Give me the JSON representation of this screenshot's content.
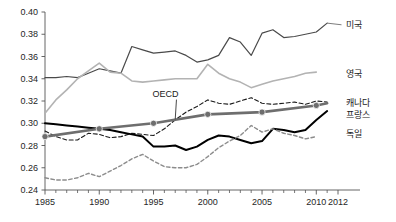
{
  "chart_data": {
    "type": "line",
    "title": "",
    "subtitle": "",
    "xlabel": "",
    "ylabel": "",
    "xlim": [
      1985,
      2012
    ],
    "ylim": [
      0.24,
      0.4
    ],
    "grid": false,
    "legend_position": "right-inline",
    "x_ticks_major": [
      "1985",
      "1990",
      "1995",
      "2000",
      "2005",
      "2010",
      "2012"
    ],
    "x_tick_values_major": [
      1985,
      1990,
      1995,
      2000,
      2005,
      2010,
      2012
    ],
    "x_tick_values_minor": [
      1986,
      1987,
      1988,
      1989,
      1991,
      1992,
      1993,
      1994,
      1996,
      1997,
      1998,
      1999,
      2001,
      2002,
      2003,
      2004,
      2006,
      2007,
      2008,
      2009,
      2011
    ],
    "y_ticks": [
      "0.24",
      "0.26",
      "0.28",
      "0.30",
      "0.32",
      "0.34",
      "0.36",
      "0.38",
      "0.40"
    ],
    "y_tick_values": [
      0.24,
      0.26,
      0.28,
      0.3,
      0.32,
      0.34,
      0.36,
      0.38,
      0.4
    ],
    "annotations": [
      {
        "text": "OECD",
        "x": 1996.1,
        "y": 0.3235,
        "leader_to_x": 1997.0,
        "leader_to_y": 0.3035
      }
    ],
    "series": [
      {
        "name": "미국",
        "label": "미국",
        "color": "#4a4a4a",
        "style": "solid",
        "width": 1.2,
        "markers": false,
        "label_x": 2012.6,
        "label_y": 0.3885,
        "leader": true,
        "x": [
          1985,
          1986,
          1987,
          1988,
          1989,
          1990,
          1991,
          1992,
          1993,
          1994,
          1995,
          1996,
          1997,
          1998,
          1999,
          2000,
          2001,
          2002,
          2003,
          2004,
          2005,
          2006,
          2007,
          2008,
          2009,
          2010,
          2011
        ],
        "values": [
          0.341,
          0.341,
          0.342,
          0.341,
          0.345,
          0.349,
          0.347,
          0.345,
          0.369,
          0.366,
          0.363,
          0.364,
          0.365,
          0.361,
          0.355,
          0.357,
          0.361,
          0.377,
          0.373,
          0.361,
          0.381,
          0.384,
          0.377,
          0.378,
          0.38,
          0.382,
          0.39
        ]
      },
      {
        "name": "영국",
        "label": "영국",
        "color": "#b3b3b3",
        "style": "solid",
        "width": 1.6,
        "markers": false,
        "label_x": 2012.6,
        "label_y": 0.3445,
        "leader": false,
        "x": [
          1985,
          1986,
          1987,
          1988,
          1989,
          1990,
          1991,
          1992,
          1993,
          1994,
          1995,
          1996,
          1997,
          1998,
          1999,
          2000,
          2001,
          2002,
          2003,
          2004,
          2005,
          2006,
          2007,
          2008,
          2009,
          2010
        ],
        "values": [
          0.309,
          0.321,
          0.33,
          0.34,
          0.347,
          0.354,
          0.346,
          0.345,
          0.338,
          0.337,
          0.338,
          0.339,
          0.34,
          0.34,
          0.34,
          0.353,
          0.345,
          0.34,
          0.337,
          0.332,
          0.335,
          0.338,
          0.34,
          0.342,
          0.345,
          0.346
        ]
      },
      {
        "name": "캐나다",
        "label": "캐나다",
        "color": "#1a1a1a",
        "style": "dashed",
        "dash": "4,2.5",
        "width": 1.1,
        "markers": false,
        "label_x": 2012.6,
        "label_y": 0.3185,
        "leader": false,
        "x": [
          1985,
          1986,
          1987,
          1988,
          1989,
          1990,
          1991,
          1992,
          1993,
          1994,
          1995,
          1996,
          1997,
          1998,
          1999,
          2000,
          2001,
          2002,
          2003,
          2004,
          2005,
          2006,
          2007,
          2008,
          2009,
          2010,
          2011
        ],
        "values": [
          0.293,
          0.288,
          0.285,
          0.285,
          0.291,
          0.29,
          0.287,
          0.288,
          0.291,
          0.29,
          0.289,
          0.295,
          0.303,
          0.31,
          0.315,
          0.321,
          0.318,
          0.317,
          0.32,
          0.323,
          0.318,
          0.317,
          0.318,
          0.319,
          0.317,
          0.32,
          0.319
        ]
      },
      {
        "name": "프랑스",
        "label": "프랑스",
        "color": "#000000",
        "style": "solid",
        "width": 2.0,
        "markers": false,
        "label_x": 2012.6,
        "label_y": 0.3075,
        "leader": false,
        "x": [
          1985,
          1986,
          1987,
          1988,
          1989,
          1990,
          1991,
          1992,
          1993,
          1994,
          1995,
          1996,
          1997,
          1998,
          1999,
          2000,
          2001,
          2002,
          2003,
          2004,
          2005,
          2006,
          2007,
          2008,
          2009,
          2010,
          2011
        ],
        "values": [
          0.3,
          0.299,
          0.298,
          0.297,
          0.296,
          0.295,
          0.294,
          0.292,
          0.29,
          0.288,
          0.279,
          0.279,
          0.28,
          0.276,
          0.279,
          0.285,
          0.289,
          0.288,
          0.285,
          0.282,
          0.284,
          0.295,
          0.294,
          0.292,
          0.294,
          0.303,
          0.311
        ]
      },
      {
        "name": "독일",
        "label": "독일",
        "color": "#8c8c8c",
        "style": "dashed",
        "dash": "3.5,2.5",
        "width": 1.4,
        "markers": false,
        "label_x": 2012.6,
        "label_y": 0.2905,
        "leader": false,
        "x": [
          1985,
          1986,
          1987,
          1988,
          1989,
          1990,
          1991,
          1992,
          1993,
          1994,
          1995,
          1996,
          1997,
          1998,
          1999,
          2000,
          2001,
          2002,
          2003,
          2004,
          2005,
          2006,
          2007,
          2008,
          2009,
          2010
        ],
        "values": [
          0.251,
          0.249,
          0.249,
          0.251,
          0.255,
          0.252,
          0.257,
          0.262,
          0.268,
          0.272,
          0.266,
          0.261,
          0.26,
          0.26,
          0.263,
          0.27,
          0.278,
          0.284,
          0.289,
          0.298,
          0.292,
          0.295,
          0.291,
          0.289,
          0.286,
          0.288
        ]
      },
      {
        "name": "OECD",
        "label": "OECD",
        "color": "#6e6e6e",
        "style": "solid",
        "width": 2.6,
        "markers": true,
        "marker_x": [
          1985,
          1990,
          1995,
          2000,
          2005,
          2010
        ],
        "marker_values": [
          0.288,
          0.295,
          0.3,
          0.308,
          0.31,
          0.316
        ],
        "label_inline": true,
        "x": [
          1985,
          1990,
          1995,
          2000,
          2005,
          2010,
          2011
        ],
        "values": [
          0.288,
          0.295,
          0.3,
          0.308,
          0.31,
          0.316,
          0.318
        ]
      }
    ]
  }
}
